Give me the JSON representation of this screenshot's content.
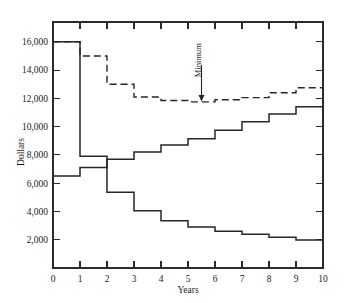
{
  "chart_data": {
    "type": "line",
    "title": "",
    "xlabel": "Years",
    "ylabel": "Dollars",
    "xlim": [
      0,
      10
    ],
    "ylim": [
      0,
      17400
    ],
    "grid": false,
    "legend_position": "none",
    "x_ticks": [
      0,
      1,
      2,
      3,
      4,
      5,
      6,
      7,
      8,
      9,
      10
    ],
    "x_tick_labels": [
      "0",
      "1",
      "2",
      "3",
      "4",
      "5",
      "6",
      "7",
      "8",
      "9",
      "10"
    ],
    "y_ticks": [
      2000,
      4000,
      6000,
      8000,
      10000,
      12000,
      14000,
      16000
    ],
    "y_tick_labels": [
      "2,000",
      "4,000",
      "6,000",
      "8,000",
      "10,000",
      "12,000",
      "14,000",
      "16,000"
    ],
    "step_intervals": [
      [
        0,
        1
      ],
      [
        1,
        2
      ],
      [
        2,
        3
      ],
      [
        3,
        4
      ],
      [
        4,
        5
      ],
      [
        5,
        6
      ],
      [
        6,
        7
      ],
      [
        7,
        8
      ],
      [
        8,
        9
      ],
      [
        9,
        10
      ]
    ],
    "series": [
      {
        "name": "Capital recovery cost",
        "style": "solid",
        "shape": "step",
        "values": [
          16000,
          7900,
          5350,
          4050,
          3350,
          2900,
          2600,
          2380,
          2180,
          1980
        ]
      },
      {
        "name": "Operating cost",
        "style": "solid",
        "shape": "step",
        "values": [
          6500,
          7100,
          7700,
          8200,
          8700,
          9150,
          9750,
          10350,
          10900,
          11400
        ]
      },
      {
        "name": "Total equivalent annual cost",
        "style": "dashed",
        "shape": "step",
        "values": [
          16000,
          15000,
          13000,
          12100,
          11850,
          11750,
          11900,
          12050,
          12400,
          12750
        ]
      }
    ],
    "annotations": [
      {
        "text": "Minimum",
        "orientation": "vertical",
        "x": 5.5,
        "y_text_top": 14700,
        "y_point": 11750,
        "arrow": "down"
      }
    ]
  },
  "axes": {
    "y_axis_title": "Dollars",
    "x_axis_title": "Years"
  },
  "colors": {
    "line": "#262626",
    "axis": "#2b2b2b",
    "background": "#ffffff",
    "text": "#1a1a1a"
  }
}
